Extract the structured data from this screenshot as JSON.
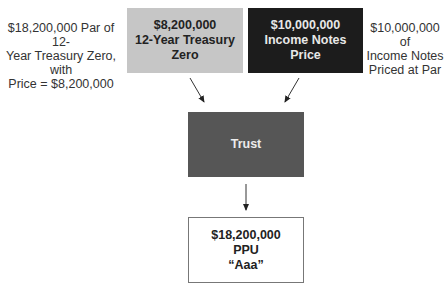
{
  "diagram": {
    "left_note": [
      "$18,200,000 Par of 12-",
      "Year Treasury Zero, with",
      "Price   = $8,200,000"
    ],
    "right_note": [
      "$10,000,000 of",
      "Income Notes",
      "Priced at Par"
    ],
    "nodes": {
      "treasury_zero": {
        "lines": [
          "$8,200,000",
          "12-Year Treasury Zero"
        ],
        "fill": "#c6c6c6"
      },
      "income_notes": {
        "lines": [
          "$10,000,000",
          "Income Notes",
          "Price"
        ],
        "fill": "#1c1c1c"
      },
      "trust": {
        "lines": [
          "Trust"
        ],
        "fill": "#565656"
      },
      "ppu": {
        "lines": [
          "$18,200,000",
          "PPU",
          "“Aaa”"
        ],
        "fill": "#ffffff"
      }
    },
    "edges": [
      {
        "from": "treasury_zero",
        "to": "trust"
      },
      {
        "from": "income_notes",
        "to": "trust"
      },
      {
        "from": "trust",
        "to": "ppu"
      }
    ]
  }
}
